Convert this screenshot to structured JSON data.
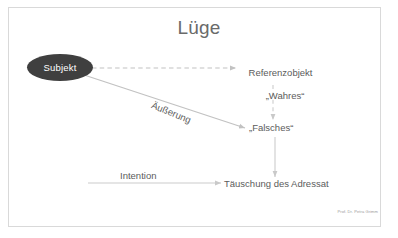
{
  "slide": {
    "title": "Lüge",
    "credit": "Prof. Dr. Petra Grimm",
    "background_color": "#ffffff",
    "frame_color": "#d9d9d9",
    "text_color": "#5b5b5b"
  },
  "nodes": {
    "subject": {
      "label": "Subjekt",
      "fill_color": "#3f3f3f",
      "text_color": "#ffffff"
    },
    "reference_object": {
      "line1": "Referenzobjekt",
      "line2": "„Wahres“"
    },
    "false_object": {
      "label": "„Falsches“"
    },
    "deception": {
      "label": "Täuschung des Adressat"
    }
  },
  "edges": {
    "subject_to_reference": {
      "label": "",
      "style": "dashed",
      "color": "#bdbdbd"
    },
    "subject_to_false": {
      "label": "Äußerung",
      "style": "solid",
      "color": "#bdbdbd"
    },
    "reference_to_false": {
      "label": "",
      "style": "dashed",
      "color": "#c9c9c9"
    },
    "false_to_deception": {
      "label": "",
      "style": "solid",
      "color": "#c9c9c9"
    },
    "intention_to_deception": {
      "label": "Intention",
      "style": "solid",
      "color": "#c9c9c9"
    }
  }
}
